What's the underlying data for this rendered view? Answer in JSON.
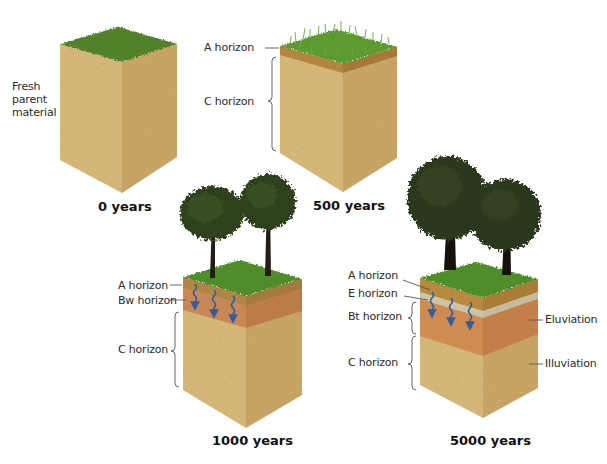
{
  "diagram": {
    "type": "soil-profile-development",
    "colors": {
      "parent_material": "#dcbb7c",
      "parent_material_dark": "#c9a665",
      "grass": "#4c8a2a",
      "grass_dark": "#3b6b1f",
      "a_horizon": "#b58a45",
      "bw_horizon": "#c98a55",
      "e_horizon": "#cfc6ad",
      "bt_horizon": "#cf8a50",
      "arrow": "#2f5f9e",
      "tree_foliage": "#2f3f1f",
      "trunk": "#1f1a14"
    },
    "stages": [
      {
        "id": "0",
        "caption": "0 years",
        "labels": [
          {
            "text": "Fresh parent material"
          }
        ]
      },
      {
        "id": "500",
        "caption": "500 years",
        "labels": [
          {
            "text": "A horizon"
          },
          {
            "text": "C horizon"
          }
        ]
      },
      {
        "id": "1000",
        "caption": "1000 years",
        "labels": [
          {
            "text": "A horizon"
          },
          {
            "text": "Bw horizon"
          },
          {
            "text": "C horizon"
          }
        ]
      },
      {
        "id": "5000",
        "caption": "5000 years",
        "labels": [
          {
            "text": "A horizon"
          },
          {
            "text": "E horizon"
          },
          {
            "text": "Bt horizon"
          },
          {
            "text": "C horizon"
          }
        ],
        "process_labels": [
          {
            "text": "Eluviation"
          },
          {
            "text": "Illuviation"
          }
        ]
      }
    ]
  }
}
